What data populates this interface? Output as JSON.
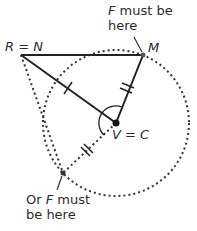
{
  "labels": {
    "rn": {
      "a": "R",
      "eq": " = ",
      "b": "N"
    },
    "m": "M",
    "vc": {
      "a": "V",
      "eq": " = ",
      "b": "C"
    },
    "top_note": {
      "f": "F",
      "line1_rest": " must be",
      "line2": "here"
    },
    "bottom_note": {
      "pre": "Or ",
      "f": "F",
      "line1_rest": " must",
      "line2": "be here"
    }
  },
  "colors": {
    "stroke": "#222222",
    "dashed": "#333333",
    "text": "#2b2b2b",
    "background": "#ffffff"
  },
  "geometry": {
    "points": {
      "R_N": [
        21,
        55
      ],
      "M": [
        143,
        55
      ],
      "V_C": [
        116,
        123
      ],
      "F_alt": [
        63,
        173
      ]
    },
    "circle": {
      "center": [
        116,
        123
      ],
      "radius": 73
    }
  }
}
